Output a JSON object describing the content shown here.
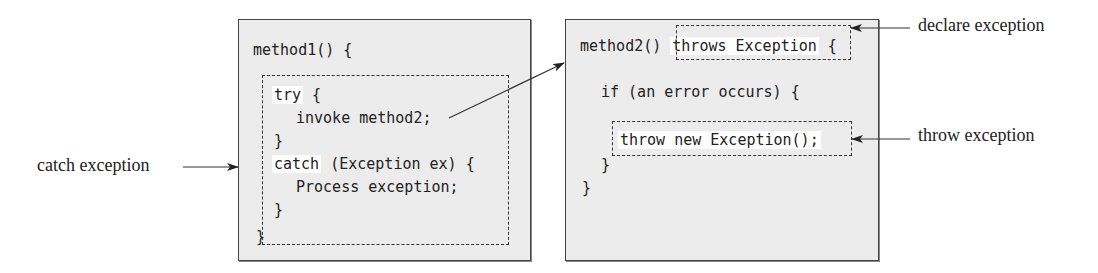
{
  "method1": {
    "header": "method1() {",
    "try_kw": "try",
    "try_open": " {",
    "invoke": "invoke method2;",
    "try_close": "}",
    "catch_kw": "catch",
    "catch_rest": " (Exception ex) {",
    "process": "Process exception;",
    "catch_close": "}",
    "close": "}"
  },
  "method2": {
    "header": "method2() ",
    "throws": "throws Exception",
    "header_brace": " {",
    "if_line": "if (an error occurs) {",
    "throw_stmt": "throw new Exception();",
    "if_close": "}",
    "close": "}"
  },
  "labels": {
    "catch_exception": "catch exception",
    "declare_exception": "declare exception",
    "throw_exception": "throw exception"
  }
}
